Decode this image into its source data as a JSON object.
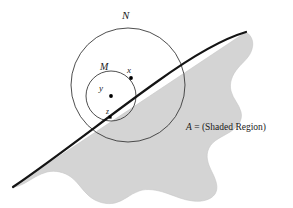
{
  "figure": {
    "canvas": {
      "width": 293,
      "height": 208,
      "background": "#ffffff"
    },
    "colors": {
      "shaded_region_fill": "#d4d4d4",
      "shaded_region_stroke": "#bdbdbd",
      "boundary_curve": "#141414",
      "circle_stroke": "#3a3a3a",
      "label_text": "#1a1a1a",
      "point_marker": "#000000"
    },
    "labels": {
      "outer_circle": "N",
      "inner_circle": "M",
      "point_x": "x",
      "point_y": "y",
      "point_z": "z"
    },
    "caption": {
      "variable": "A",
      "equals": " = ",
      "description": "(Shaded Region)",
      "full_text": "A = (Shaded Region)"
    },
    "geometry": {
      "outer_circle": {
        "cx": 128,
        "cy": 85,
        "r": 57,
        "stroke_width": 0.9
      },
      "inner_circle": {
        "cx": 111,
        "cy": 96,
        "r": 25,
        "stroke_width": 0.9
      },
      "points": [
        {
          "name": "x",
          "cx": 131,
          "cy": 78,
          "marker": "dot",
          "r": 1.9
        },
        {
          "name": "y",
          "cx": 111,
          "cy": 96,
          "marker": "dot",
          "r": 1.9
        },
        {
          "name": "z",
          "cx": 110,
          "cy": 117,
          "marker": "square",
          "size": 3.0
        }
      ],
      "boundary_curve": {
        "description": "thick curve from lower-left to upper-right forming the top-left edge of region A",
        "start": [
          13,
          187
        ],
        "end": [
          246,
          32
        ],
        "stroke_width": 2.2
      }
    }
  }
}
